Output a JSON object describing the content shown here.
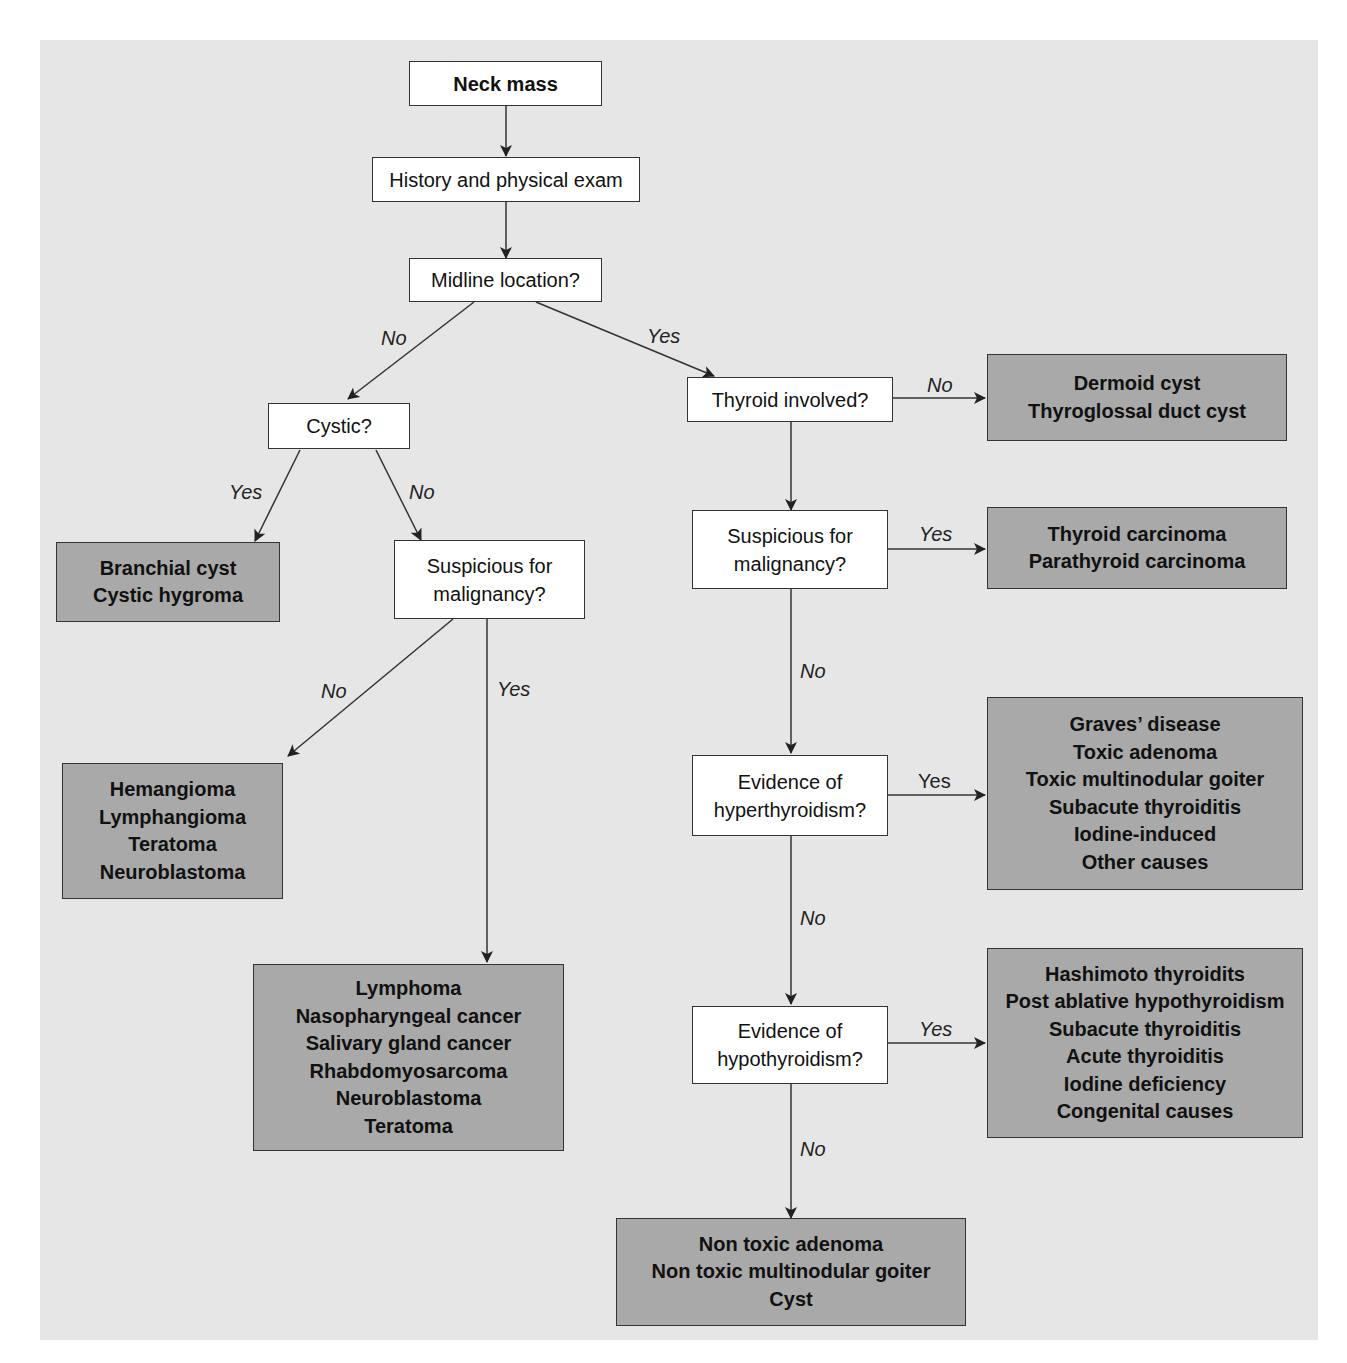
{
  "diagram": {
    "type": "flowchart",
    "colors": {
      "panel_bg": "#e6e6e6",
      "decision_bg": "#ffffff",
      "outcome_bg": "#a9a9a9",
      "line": "#333333"
    },
    "nodes": {
      "neck_mass": {
        "text": "Neck mass"
      },
      "history": {
        "text": "History and physical exam"
      },
      "midline": {
        "text": "Midline location?"
      },
      "cystic": {
        "text": "Cystic?"
      },
      "thyroid_involved": {
        "text": "Thyroid involved?"
      },
      "susp_left": {
        "lines": [
          "Suspicious for",
          "malignancy?"
        ]
      },
      "susp_right": {
        "lines": [
          "Suspicious for",
          "malignancy?"
        ]
      },
      "hyper": {
        "lines": [
          "Evidence of",
          "hyperthyroidism?"
        ]
      },
      "hypo": {
        "lines": [
          "Evidence of",
          "hypothyroidism?"
        ]
      }
    },
    "outcomes": {
      "midline_no_thyroid": {
        "lines": [
          "Dermoid cyst",
          "Thyroglossal duct cyst"
        ]
      },
      "cystic_yes": {
        "lines": [
          "Branchial cyst",
          "Cystic hygroma"
        ]
      },
      "thyroid_malignant": {
        "lines": [
          "Thyroid carcinoma",
          "Parathyroid carcinoma"
        ]
      },
      "lateral_benign": {
        "lines": [
          "Hemangioma",
          "Lymphangioma",
          "Teratoma",
          "Neuroblastoma"
        ]
      },
      "lateral_malignant": {
        "lines": [
          "Lymphoma",
          "Nasopharyngeal cancer",
          "Salivary gland cancer",
          "Rhabdomyosarcoma",
          "Neuroblastoma",
          "Teratoma"
        ]
      },
      "hyperthyroid": {
        "lines": [
          "Graves’ disease",
          "Toxic adenoma",
          "Toxic multinodular goiter",
          "Subacute thyroiditis",
          "Iodine-induced",
          "Other causes"
        ]
      },
      "hypothyroid": {
        "lines": [
          "Hashimoto thyroidits",
          "Post ablative hypothyroidism",
          "Subacute thyroiditis",
          "Acute thyroiditis",
          "Iodine deficiency",
          "Congenital causes"
        ]
      },
      "euthyroid": {
        "lines": [
          "Non toxic adenoma",
          "Non toxic multinodular goiter",
          "Cyst"
        ]
      }
    },
    "edge_labels": {
      "midline_no": "No",
      "midline_yes": "Yes",
      "thyroid_no": "No",
      "cystic_yes": "Yes",
      "cystic_no": "No",
      "susp_left_no": "No",
      "susp_left_yes": "Yes",
      "susp_right_yes": "Yes",
      "susp_right_no": "No",
      "hyper_yes": "Yes",
      "hyper_no": "No",
      "hypo_yes": "Yes",
      "hypo_no": "No"
    }
  }
}
